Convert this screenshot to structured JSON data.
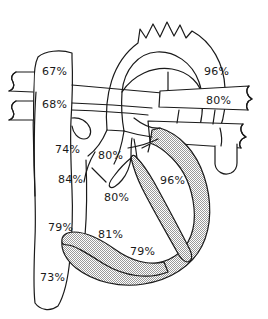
{
  "diagram": {
    "type": "anatomical-line-drawing",
    "style": {
      "stroke_color": "#1a1a1a",
      "fill_color": "#ffffff",
      "shade_color": "#c8c8c8",
      "background_color": "#ffffff",
      "stroke_width": "1.2"
    },
    "labels": [
      {
        "id": "svc-upper",
        "text": "67%",
        "x": 42,
        "y": 66,
        "region": "superior-vena-cava"
      },
      {
        "id": "svc-lower",
        "text": "68%",
        "x": 42,
        "y": 99,
        "region": "superior-vena-cava-lower"
      },
      {
        "id": "right-atrium",
        "text": "74%",
        "x": 55,
        "y": 144,
        "region": "right-atrium"
      },
      {
        "id": "right-atrium-mid",
        "text": "84%",
        "x": 58,
        "y": 174,
        "region": "right-atrium-mid"
      },
      {
        "id": "ra-ivc-junction",
        "text": "79%",
        "x": 48,
        "y": 222,
        "region": "right-atrium-inferior"
      },
      {
        "id": "ivc",
        "text": "73%",
        "x": 40,
        "y": 272,
        "region": "inferior-vena-cava"
      },
      {
        "id": "ductus",
        "text": "80%",
        "x": 98,
        "y": 150,
        "region": "ductus-arteriosus"
      },
      {
        "id": "right-ventricle",
        "text": "80%",
        "x": 104,
        "y": 192,
        "region": "right-ventricle"
      },
      {
        "id": "tricuspid",
        "text": "81%",
        "x": 98,
        "y": 229,
        "region": "tricuspid-inflow"
      },
      {
        "id": "rv-outflow",
        "text": "79%",
        "x": 130,
        "y": 246,
        "region": "right-ventricle-apex"
      },
      {
        "id": "aorta",
        "text": "96%",
        "x": 204,
        "y": 66,
        "region": "aortic-arch"
      },
      {
        "id": "pulmonary-artery",
        "text": "80%",
        "x": 206,
        "y": 95,
        "region": "pulmonary-artery"
      },
      {
        "id": "left-ventricle",
        "text": "96%",
        "x": 160,
        "y": 175,
        "region": "left-ventricle"
      }
    ]
  }
}
